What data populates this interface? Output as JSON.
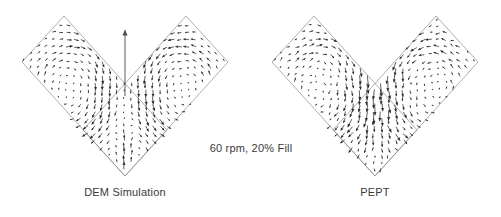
{
  "figure": {
    "center_label": "60 rpm, 20% Fill",
    "background_color": "#ffffff",
    "vector_color": "#2b2b2b",
    "outline_color": "#8d8d8d",
    "text_color": "#3a3a3a"
  },
  "panels": [
    {
      "id": "dem",
      "caption": "DEM Simulation",
      "has_central_jet_arrow": true
    },
    {
      "id": "pept",
      "caption": "PEPT",
      "has_central_jet_arrow": false
    }
  ],
  "chart_data": {
    "type": "scatter",
    "subtype": "quiver-vector-field",
    "title": "60 rpm, 20% Fill",
    "xlabel": "",
    "ylabel": "",
    "xlim": [
      0,
      250
    ],
    "ylim": [
      0,
      192
    ],
    "grid": false,
    "legend_position": "none",
    "annotations": [
      "60 rpm, 20% Fill",
      "DEM Simulation",
      "PEPT"
    ],
    "domain_shape": {
      "name": "v-blender-chevron",
      "description": "Two overlapping rhombus arms meeting at a lower apex forming a V cross-section",
      "apex": [
        125,
        176
      ],
      "left_arm_corners": [
        [
          125,
          176
        ],
        [
          22,
          62
        ],
        [
          64,
          16
        ],
        [
          167,
          130
        ]
      ],
      "right_arm_corners": [
        [
          125,
          176
        ],
        [
          228,
          62
        ],
        [
          186,
          16
        ],
        [
          83,
          130
        ]
      ]
    },
    "series": [
      {
        "name": "DEM Simulation",
        "panel": "dem",
        "vortices": [
          {
            "name": "left-vortex",
            "center": [
              85,
              88
            ],
            "sense": "counterclockwise",
            "radius": 46
          },
          {
            "name": "right-vortex",
            "center": [
              166,
              88
            ],
            "sense": "clockwise",
            "radius": 46
          }
        ],
        "central_jet": {
          "x": 125,
          "y_base": 96,
          "y_tip": 30,
          "direction": "up",
          "magnitude": 66
        },
        "n_vectors": 520,
        "max_magnitude": 14
      },
      {
        "name": "PEPT",
        "panel": "pept",
        "vortices": [
          {
            "name": "left-vortex",
            "center": [
              85,
              88
            ],
            "sense": "counterclockwise",
            "radius": 46
          },
          {
            "name": "right-vortex",
            "center": [
              166,
              88
            ],
            "sense": "clockwise",
            "radius": 46
          }
        ],
        "central_jet": null,
        "n_vectors": 520,
        "max_magnitude": 12
      }
    ]
  }
}
